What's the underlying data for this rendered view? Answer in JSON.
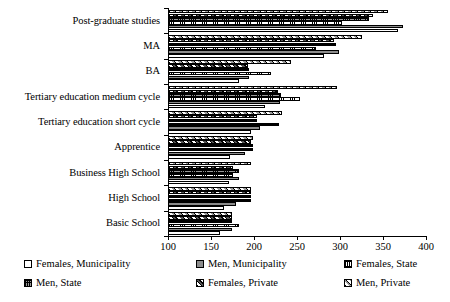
{
  "chart_data": {
    "type": "bar",
    "orientation": "horizontal",
    "title": "",
    "xlabel": "",
    "ylabel": "",
    "xlim": [
      100,
      400
    ],
    "xticks": [
      100,
      150,
      200,
      250,
      300,
      350,
      400
    ],
    "grid": false,
    "legend_position": "bottom",
    "categories": [
      "Post-graduate studies",
      "MA",
      "BA",
      "Tertiary education medium cycle",
      "Tertiary education short cycle",
      "Apprentice",
      "Business High School",
      "High School",
      "Basic School"
    ],
    "series": [
      {
        "name": "Females, Municipality",
        "pattern": "empty",
        "color": "#ffffff",
        "values": [
          367,
          281,
          182,
          213,
          197,
          172,
          171,
          165,
          160
        ]
      },
      {
        "name": "Men, Municipality",
        "pattern": "solid-gray",
        "color": "#8c8c8c",
        "values": [
          373,
          299,
          194,
          230,
          207,
          190,
          182,
          179,
          174
        ]
      },
      {
        "name": "Females, State",
        "pattern": "fine-grid",
        "color": "#ffffff",
        "values": [
          302,
          272,
          220,
          253,
          229,
          199,
          175,
          196,
          183
        ]
      },
      {
        "name": "Men, State",
        "pattern": "brick",
        "color": "#9a9a9a",
        "values": [
          334,
          295,
          194,
          231,
          204,
          199,
          182,
          196,
          174
        ]
      },
      {
        "name": "Females, Private",
        "pattern": "dark-diagonal",
        "color": "#777777",
        "values": [
          338,
          293,
          193,
          228,
          203,
          197,
          176,
          196,
          174
        ]
      },
      {
        "name": "Men, Private",
        "pattern": "light-diagonal",
        "color": "#cfcfcf",
        "values": [
          356,
          325,
          243,
          296,
          232,
          199,
          197,
          196,
          174
        ]
      }
    ]
  },
  "legend": {
    "items": [
      {
        "label": "Females, Municipality",
        "swatch": "s-fem-mun"
      },
      {
        "label": "Men, Municipality",
        "swatch": "s-men-mun"
      },
      {
        "label": "Females, State",
        "swatch": "s-fem-state"
      },
      {
        "label": "Men, State",
        "swatch": "s-men-state"
      },
      {
        "label": "Females, Private",
        "swatch": "s-fem-priv"
      },
      {
        "label": "Men, Private",
        "swatch": "s-men-priv"
      }
    ]
  }
}
